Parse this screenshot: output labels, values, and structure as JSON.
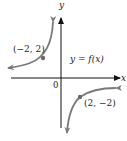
{
  "diagram": {
    "type": "function-graph",
    "axes": {
      "x_label": "x",
      "y_label": "y",
      "origin_label": "0"
    },
    "function_label": "y = f(x)",
    "points": [
      {
        "label": "(−2, 2)",
        "x": -2,
        "y": 2
      },
      {
        "label": "(2, −2)",
        "x": 2,
        "y": -2
      }
    ],
    "branches": [
      {
        "name": "upper-left",
        "quadrant": "II",
        "description": "approaches y-axis upward and x-axis leftward"
      },
      {
        "name": "lower-right",
        "quadrant": "IV",
        "description": "approaches y-axis downward and x-axis rightward"
      }
    ],
    "colors": {
      "axes": "#111111",
      "curve": "#7a7a7a",
      "point": "#6a6a6a",
      "text": "#222222"
    }
  }
}
